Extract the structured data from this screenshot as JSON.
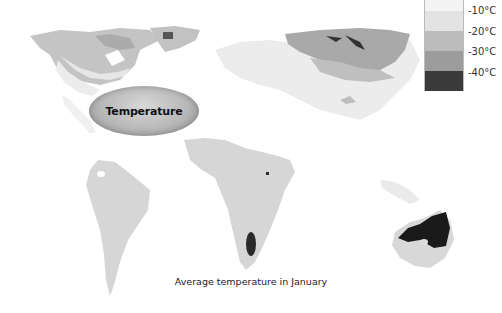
{
  "map": {
    "title": "Average temperature in January",
    "label_oval": "Temperature",
    "colors": {
      "band_0_to_minus10": "#f1f1f1",
      "band_minus10_to_minus20": "#e0e0e0",
      "band_minus20_to_minus30": "#bdbdbd",
      "band_minus30_to_minus40": "#a0a0a0",
      "band_below_minus40": "#2a2a2a",
      "mild": "#d7d7d7"
    }
  },
  "legend": {
    "items": [
      {
        "label": "-10°C",
        "color": "#f4f4f4"
      },
      {
        "label": "-20°C",
        "color": "#e3e3e3"
      },
      {
        "label": "-30°C",
        "color": "#bcbcbc"
      },
      {
        "label": "-40°C",
        "color": "#9c9c9c"
      },
      {
        "label": "",
        "color": "#3a3a3a"
      }
    ]
  }
}
